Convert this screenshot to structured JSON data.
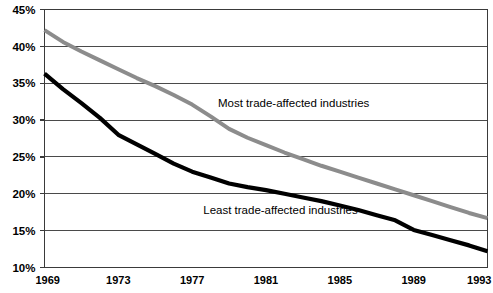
{
  "chart_data": {
    "type": "line",
    "title": "",
    "subtitle": "",
    "xlabel": "",
    "ylabel": "",
    "xlim": [
      1969,
      1993
    ],
    "ylim": [
      10,
      45
    ],
    "grid": true,
    "legend_position": "inline-annotation",
    "x": [
      1969,
      1970,
      1971,
      1972,
      1973,
      1974,
      1975,
      1976,
      1977,
      1978,
      1979,
      1980,
      1981,
      1982,
      1983,
      1984,
      1985,
      1986,
      1987,
      1988,
      1989,
      1990,
      1991,
      1992,
      1993
    ],
    "y_tick_labels": [
      "10%",
      "15%",
      "20%",
      "25%",
      "30%",
      "35%",
      "40%",
      "45%"
    ],
    "y_tick_values": [
      10,
      15,
      20,
      25,
      30,
      35,
      40,
      45
    ],
    "x_tick_labels": [
      "1969",
      "1973",
      "1977",
      "1981",
      "1985",
      "1989",
      "1993"
    ],
    "x_tick_values": [
      1969,
      1973,
      1977,
      1981,
      1985,
      1989,
      1993
    ],
    "series": [
      {
        "name": "Most trade-affected industries",
        "color": "#8c8c8c",
        "stroke_width": 4.0,
        "annotation": "Most trade-affected industries",
        "annotation_x": 1978.4,
        "annotation_y": 31.8,
        "values": [
          42.2,
          40.6,
          39.3,
          38.1,
          36.9,
          35.7,
          34.6,
          33.4,
          32.1,
          30.5,
          28.8,
          27.6,
          26.6,
          25.6,
          24.7,
          23.8,
          23.0,
          22.2,
          21.4,
          20.6,
          19.8,
          19.0,
          18.2,
          17.4,
          16.7
        ]
      },
      {
        "name": "Least trade-affected industries",
        "color": "#000000",
        "stroke_width": 4.2,
        "annotation": "Least trade-affected industries",
        "annotation_x": 1977.6,
        "annotation_y": 17.2,
        "values": [
          36.3,
          34.2,
          32.3,
          30.3,
          28.0,
          26.7,
          25.4,
          24.1,
          23.0,
          22.2,
          21.4,
          20.9,
          20.5,
          20.0,
          19.5,
          19.0,
          18.4,
          17.8,
          17.1,
          16.4,
          15.1,
          14.4,
          13.7,
          13.0,
          12.2
        ]
      }
    ]
  },
  "axes": {
    "y_axis_name": "percent-axis",
    "x_axis_name": "year-axis"
  }
}
